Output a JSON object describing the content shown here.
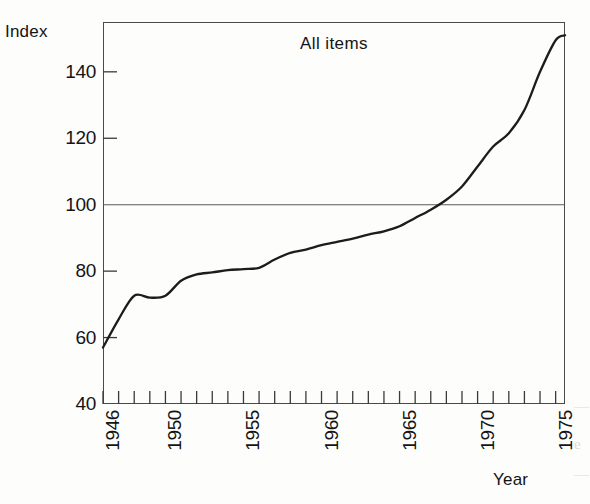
{
  "figure": {
    "y_axis_title": "Index",
    "x_axis_title": "Year"
  },
  "margin_bleed": {
    "line1": "—",
    "line2": "e",
    "line3": "—"
  },
  "chart_data": {
    "type": "line",
    "title": "All items",
    "xlabel": "Year",
    "ylabel": "Index",
    "xlim": [
      1946,
      1975.6
    ],
    "ylim": [
      40,
      155
    ],
    "grid": false,
    "legend": "none",
    "y_ticks": [
      40,
      60,
      80,
      100,
      120,
      140
    ],
    "y_tick_labels": [
      "40",
      "60",
      "80",
      "100",
      "120",
      "140"
    ],
    "x_ticks": [
      1946,
      1947,
      1948,
      1949,
      1950,
      1951,
      1952,
      1953,
      1954,
      1955,
      1956,
      1957,
      1958,
      1959,
      1960,
      1961,
      1962,
      1963,
      1964,
      1965,
      1966,
      1967,
      1968,
      1969,
      1970,
      1971,
      1972,
      1973,
      1974,
      1975
    ],
    "x_tick_labels": [
      "1946",
      "1950",
      "1955",
      "1960",
      "1965",
      "1970",
      "1975"
    ],
    "x_tick_label_years": [
      1946,
      1950,
      1955,
      1960,
      1965,
      1970,
      1975
    ],
    "reference_line": {
      "y": 100,
      "label": "100"
    },
    "series": [
      {
        "name": "All items",
        "x": [
          1946,
          1947,
          1948,
          1949,
          1950,
          1951,
          1952,
          1953,
          1954,
          1955,
          1956,
          1957,
          1958,
          1959,
          1960,
          1961,
          1962,
          1963,
          1964,
          1965,
          1966,
          1967,
          1968,
          1969,
          1970,
          1971,
          1972,
          1973,
          1974,
          1975,
          1975.6
        ],
        "values": [
          57.0,
          65.5,
          72.6,
          72.0,
          72.6,
          77.1,
          79.0,
          79.6,
          80.3,
          80.6,
          81.0,
          83.5,
          85.5,
          86.5,
          87.8,
          88.8,
          89.8,
          91.0,
          92.0,
          93.5,
          96.0,
          98.5,
          101.5,
          105.5,
          111.5,
          117.5,
          121.5,
          128.5,
          140.0,
          149.5,
          151.0
        ]
      }
    ]
  }
}
